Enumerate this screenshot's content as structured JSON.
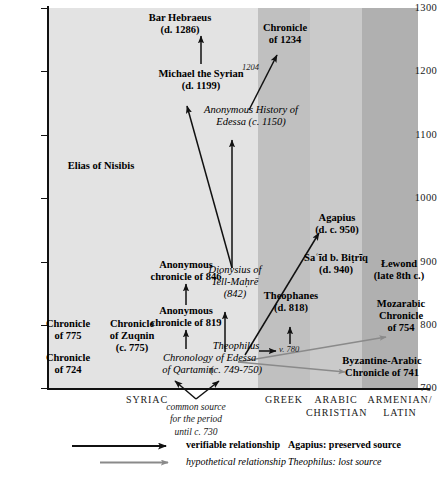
{
  "figure": {
    "type": "stemma-diagram",
    "axis_y": {
      "label": "",
      "ticks": [
        "1300",
        "1200",
        "1100",
        "1000",
        "900",
        "800",
        "700"
      ],
      "min": 700,
      "max": 1300
    },
    "columns": [
      {
        "id": "syriac",
        "caption_line1": "SYRIAC",
        "caption_line2": "",
        "color": "#e3e3e3"
      },
      {
        "id": "greek",
        "caption_line1": "GREEK",
        "caption_line2": "",
        "color": "#c0c0c0"
      },
      {
        "id": "arabic",
        "caption_line1": "ARABIC",
        "caption_line2": "CHRISTIAN",
        "color": "#cacaca"
      },
      {
        "id": "armenian",
        "caption_line1": "ARMENIAN/",
        "caption_line2": "LATIN",
        "color": "#b0b0b0"
      }
    ],
    "nodes": [
      {
        "id": "bar-hebraeus",
        "line1": "Bar Hebraeus",
        "line2": "(d. 1286)",
        "kind": "preserved"
      },
      {
        "id": "chronicle-1234",
        "line1": "Chronicle",
        "line2": "of 1234",
        "kind": "preserved"
      },
      {
        "id": "michael-syrian",
        "line1": "Michael the Syrian",
        "line2": "(d. 1199)",
        "kind": "preserved"
      },
      {
        "id": "anon-history-edessa",
        "line1": "Anonymous History of",
        "line2": "Edessa (c. 1150)",
        "kind": "lost"
      },
      {
        "id": "elias-nisibis",
        "line1": "Elias of Nisibis",
        "line2": "",
        "kind": "preserved"
      },
      {
        "id": "agapius",
        "line1": "Agapius",
        "line2": "(d. c. 950)",
        "kind": "preserved"
      },
      {
        "id": "said-b-bitriq",
        "line1": "Saʿīd b. Biṭrīq",
        "line2": "(d. 940)",
        "kind": "preserved"
      },
      {
        "id": "lewond",
        "line1": "Łewond",
        "line2": "(late 8th c.)",
        "kind": "preserved"
      },
      {
        "id": "anon-chronicle-846",
        "line1": "Anonymous",
        "line2": "chronicle of 846",
        "kind": "preserved"
      },
      {
        "id": "anon-chronicle-819",
        "line1": "Anonymous",
        "line2": "chronicle of 819",
        "kind": "preserved"
      },
      {
        "id": "dionysius",
        "line1": "Dionysius of",
        "line2": "Tell-Maḥrē",
        "line3": "(842)",
        "kind": "lost"
      },
      {
        "id": "theophanes",
        "line1": "Theophanes",
        "line2": "(d. 818)",
        "kind": "preserved"
      },
      {
        "id": "mozarabic-754",
        "line1": "Mozarabic",
        "line2": "Chronicle",
        "line3": "of 754",
        "kind": "preserved"
      },
      {
        "id": "chronicle-775",
        "line1": "Chronicle",
        "line2": "of 775",
        "kind": "preserved"
      },
      {
        "id": "chronicle-zuqnin",
        "line1": "Chronicle",
        "line2": "of Zuqnin",
        "line3": "(c. 775)",
        "kind": "preserved"
      },
      {
        "id": "chronicle-724",
        "line1": "Chronicle",
        "line2": "of 724",
        "kind": "preserved"
      },
      {
        "id": "chronology-qartamin",
        "line1": "Chronology",
        "line2": "of Qartamin",
        "kind": "lost"
      },
      {
        "id": "theophilus-edessa",
        "line1": "Theophilus",
        "line2": "of Edessa",
        "line3": "(c. 749-750)",
        "kind": "lost"
      },
      {
        "id": "byzantine-arabic-741",
        "line1": "Byzantine-Arabic",
        "line2": "Chronicle of 741",
        "kind": "preserved"
      }
    ],
    "edge_labels": [
      {
        "id": "edge-label-1204",
        "text": "1204"
      },
      {
        "id": "edge-label-780",
        "text": "v. 780"
      }
    ],
    "common_source_note": {
      "line1": "common source",
      "line2": "for the period",
      "line3": "until c. 730"
    },
    "legend": {
      "verifiable": "verifiable relationship",
      "hypothetical": "hypothetical relationship",
      "preserved_key": "Agapius: preserved source",
      "lost_key": "Theophilus: lost source",
      "arrow_color_verifiable": "#111111",
      "arrow_color_hypothetical": "#8a8a8a"
    }
  }
}
